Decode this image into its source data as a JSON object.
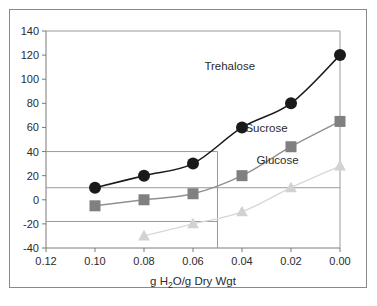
{
  "chart_data": {
    "type": "line",
    "title": "",
    "subtitle": "",
    "xlabel": "g H2O/g Dry Wgt",
    "xlabel_parts": {
      "prefix": "g H",
      "subscript": "2",
      "suffix": "O/g Dry Wgt"
    },
    "ylabel": "",
    "x": [
      0.1,
      0.08,
      0.06,
      0.04,
      0.02,
      0.0
    ],
    "xlim": [
      0.12,
      0.0
    ],
    "ylim": [
      -40,
      140
    ],
    "xticks": [
      0.12,
      0.1,
      0.08,
      0.06,
      0.04,
      0.02,
      0.0
    ],
    "xtick_labels": [
      "0.12",
      "0.10",
      "0.08",
      "0.06",
      "0.04",
      "0.02",
      "0.00"
    ],
    "yticks": [
      -40,
      -20,
      0,
      20,
      40,
      60,
      80,
      100,
      120,
      140
    ],
    "ytick_labels": [
      "-40",
      "-20",
      "0",
      "20",
      "40",
      "60",
      "80",
      "100",
      "120",
      "140"
    ],
    "x_axis_reversed": true,
    "grid": false,
    "legend_position": "inline-annotations",
    "reference_lines": {
      "horizontal": [
        40,
        10,
        -18
      ],
      "vertical": [
        0.05
      ]
    },
    "series": [
      {
        "name": "Trehalose",
        "marker": "circle",
        "color": "#1a1a1a",
        "line_color": "#1a1a1a",
        "x": [
          0.1,
          0.08,
          0.06,
          0.04,
          0.02,
          0.0
        ],
        "values": [
          10,
          20,
          30,
          60,
          80,
          120
        ],
        "label_x": 0.045,
        "label_y": 108
      },
      {
        "name": "Sucrose",
        "marker": "square",
        "color": "#808080",
        "line_color": "#909090",
        "x": [
          0.1,
          0.08,
          0.06,
          0.04,
          0.02,
          0.0
        ],
        "values": [
          -5,
          0,
          5,
          20,
          44,
          65
        ],
        "label_x": 0.03,
        "label_y": 56
      },
      {
        "name": "Glucose",
        "marker": "triangle",
        "color": "#d2d2d2",
        "line_color": "#d8d8d8",
        "x": [
          0.08,
          0.06,
          0.04,
          0.02,
          0.0
        ],
        "values": [
          -30,
          -20,
          -10,
          10,
          28
        ],
        "label_x": 0.0255,
        "label_y": 30
      }
    ]
  },
  "colors": {
    "frame": "#8a8a8a",
    "axis": "#7a7a7a",
    "reference_line": "#9a9a9a",
    "text": "#2b2b2b",
    "background": "#ffffff",
    "trehalose": "#1a1a1a",
    "sucrose": "#808080",
    "glucose": "#d2d2d2"
  }
}
